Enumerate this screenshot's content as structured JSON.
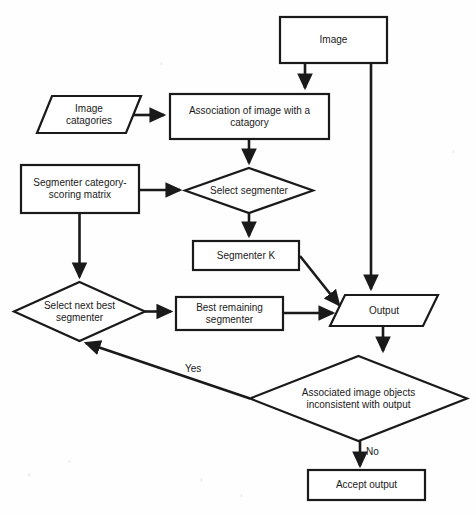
{
  "diagram": {
    "background_color": "#fefefe",
    "stroke_color": "#1a1a1a",
    "fill_color": "#ffffff",
    "type": "flowchart"
  },
  "nodes": {
    "image": {
      "label": "Image",
      "shape": "rectangle",
      "x": 280,
      "y": 17,
      "w": 107,
      "h": 46
    },
    "image_categories": {
      "label": "Image\ncatagories",
      "shape": "parallelogram",
      "x": 37,
      "y": 96,
      "w": 104,
      "h": 37
    },
    "association": {
      "label": "Association of image with a\ncatagory",
      "shape": "rectangle",
      "x": 170,
      "y": 94,
      "w": 159,
      "h": 45
    },
    "scoring_matrix": {
      "label": "Segmenter category-\nscoring matrix",
      "shape": "rectangle",
      "x": 21,
      "y": 165,
      "w": 118,
      "h": 48
    },
    "select_segmenter": {
      "label": "Select segmenter",
      "shape": "diamond",
      "x": 185,
      "y": 168,
      "w": 128,
      "h": 45
    },
    "segmenter_k": {
      "label": "Segmenter K",
      "shape": "rectangle",
      "x": 193,
      "y": 241,
      "w": 106,
      "h": 29
    },
    "select_next_best": {
      "label": "Select next best\nsegmenter",
      "shape": "diamond",
      "x": 14,
      "y": 282,
      "w": 131,
      "h": 59
    },
    "best_remaining": {
      "label": "Best remaining\nsegmenter",
      "shape": "rectangle",
      "x": 176,
      "y": 297,
      "w": 107,
      "h": 33
    },
    "output": {
      "label": "Output",
      "shape": "parallelogram",
      "x": 330,
      "y": 295,
      "w": 108,
      "h": 31
    },
    "inconsistent": {
      "label": "Associated image objects\ninconsistent with output",
      "shape": "diamond",
      "x": 250,
      "y": 356,
      "w": 217,
      "h": 85
    },
    "accept_output": {
      "label": "Accept output",
      "shape": "rectangle",
      "x": 308,
      "y": 470,
      "w": 117,
      "h": 30
    }
  },
  "edge_labels": {
    "yes": "Yes",
    "no": "No"
  },
  "edges": [
    {
      "from": "image",
      "to": "association",
      "kind": "arrow-down"
    },
    {
      "from": "image",
      "to": "output",
      "kind": "arrow-down-right"
    },
    {
      "from": "image_categories",
      "to": "association",
      "kind": "arrow-right"
    },
    {
      "from": "association",
      "to": "select_segmenter",
      "kind": "arrow-down"
    },
    {
      "from": "scoring_matrix",
      "to": "select_segmenter",
      "kind": "arrow-right"
    },
    {
      "from": "scoring_matrix",
      "to": "select_next_best",
      "kind": "arrow-down"
    },
    {
      "from": "select_segmenter",
      "to": "segmenter_k",
      "kind": "arrow-down"
    },
    {
      "from": "segmenter_k",
      "to": "output",
      "kind": "arrow-diagonal"
    },
    {
      "from": "select_next_best",
      "to": "best_remaining",
      "kind": "arrow-right"
    },
    {
      "from": "best_remaining",
      "to": "output",
      "kind": "arrow-right"
    },
    {
      "from": "output",
      "to": "inconsistent",
      "kind": "arrow-down"
    },
    {
      "from": "inconsistent",
      "to": "select_next_best",
      "kind": "arrow-diagonal",
      "label": "Yes"
    },
    {
      "from": "inconsistent",
      "to": "accept_output",
      "kind": "arrow-down",
      "label": "No"
    }
  ]
}
